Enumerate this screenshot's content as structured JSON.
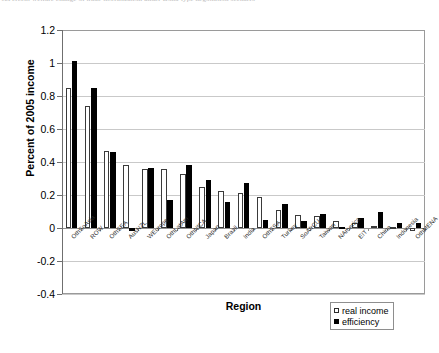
{
  "caption": {
    "number": "12",
    "text": "Percent welfare change of trade liberalization under Doha-type negotiation scenario"
  },
  "chart_data": {
    "type": "bar",
    "title": "",
    "xlabel": "Region",
    "ylabel": "Percent of 2005 income",
    "ylim": [
      -0.4,
      1.2
    ],
    "yticks": [
      "1.2",
      "1",
      "0.8",
      "0.6",
      "0.4",
      "0.2",
      "0",
      "-0.2",
      "-0.4"
    ],
    "ytick_values": [
      1.2,
      1.0,
      0.8,
      0.6,
      0.4,
      0.2,
      0,
      -0.2,
      -0.4
    ],
    "grid": true,
    "legend_position": "bottom-right",
    "categories": [
      "OthSoAsia",
      "ROW",
      "OthSEA",
      "AusNZL",
      "WEurope",
      "OthLatAm",
      "OthNfCA",
      "Japan",
      "Brazil",
      "India",
      "OthSSA",
      "Turkey",
      "SoAfrCU",
      "Taiwan",
      "NAmerica",
      "EIT",
      "China",
      "Indonesia",
      "OthMENA"
    ],
    "series": [
      {
        "name": "real income",
        "color": "#ffffff",
        "values": [
          0.85,
          0.74,
          0.465,
          0.38,
          0.355,
          0.355,
          0.33,
          0.25,
          0.225,
          0.21,
          0.19,
          0.11,
          0.08,
          0.07,
          0.04,
          0.03,
          0.01,
          0.005,
          -0.02
        ]
      },
      {
        "name": "efficiency",
        "color": "#000000",
        "values": [
          1.01,
          0.85,
          0.46,
          -0.02,
          0.365,
          0.17,
          0.38,
          0.29,
          0.155,
          0.27,
          0.05,
          0.145,
          0.04,
          0.085,
          0.005,
          0.06,
          0.1,
          0.03,
          0.03
        ]
      }
    ]
  },
  "legend": {
    "items": [
      {
        "label": "real income"
      },
      {
        "label": "efficiency"
      }
    ]
  }
}
